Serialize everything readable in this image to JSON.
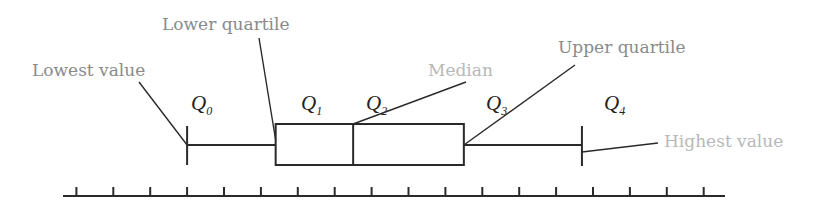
{
  "diagram": {
    "colors": {
      "ink": "#2a2a2a",
      "label_dark": "#8a8a8a",
      "label_light": "#b8b8b8"
    },
    "axis": {
      "tick_count": 18,
      "min": 0,
      "max": 18
    },
    "values": {
      "Q0": 4,
      "Q1": 6.4,
      "Q2": 8.5,
      "Q3": 11.5,
      "Q4": 14.7
    },
    "labels": [
      {
        "id": "lowest",
        "text": "Lowest value",
        "points_to": "Q0",
        "tone": "dark"
      },
      {
        "id": "lower_quartile",
        "text": "Lower quartile",
        "points_to": "Q1",
        "tone": "dark"
      },
      {
        "id": "median",
        "text": "Median",
        "points_to": "Q2",
        "tone": "light"
      },
      {
        "id": "upper_quartile",
        "text": "Upper quartile",
        "points_to": "Q3",
        "tone": "dark"
      },
      {
        "id": "highest",
        "text": "Highest value",
        "points_to": "Q4",
        "tone": "light"
      }
    ],
    "quartiles": [
      {
        "id": "Q0",
        "symbol": "Q",
        "sub": "0"
      },
      {
        "id": "Q1",
        "symbol": "Q",
        "sub": "1"
      },
      {
        "id": "Q2",
        "symbol": "Q",
        "sub": "2"
      },
      {
        "id": "Q3",
        "symbol": "Q",
        "sub": "3"
      },
      {
        "id": "Q4",
        "symbol": "Q",
        "sub": "4"
      }
    ]
  }
}
